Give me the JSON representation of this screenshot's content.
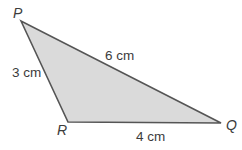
{
  "figure": {
    "kind": "geometry-diagram",
    "shape": "triangle",
    "background_color": "#ffffff",
    "fill_color": "#dadada",
    "stroke_color": "#555555",
    "text_color": "#3c3c3c",
    "stroke_width": 1.6,
    "vertices": [
      {
        "name": "P",
        "label": "P",
        "x": 21,
        "y": 21
      },
      {
        "name": "R",
        "label": "R",
        "x": 68,
        "y": 122
      },
      {
        "name": "Q",
        "label": "Q",
        "x": 221,
        "y": 123
      }
    ],
    "sides": [
      {
        "name": "PQ",
        "label": "6 cm",
        "length": 6,
        "unit": "cm"
      },
      {
        "name": "PR",
        "label": "3 cm",
        "length": 3,
        "unit": "cm"
      },
      {
        "name": "RQ",
        "label": "4 cm",
        "length": 4,
        "unit": "cm"
      }
    ]
  },
  "chart_data": {
    "type": "diagram",
    "title": "",
    "shape": "triangle",
    "vertex_labels": [
      "P",
      "R",
      "Q"
    ],
    "vertex_points": [
      [
        21,
        21
      ],
      [
        68,
        122
      ],
      [
        221,
        123
      ]
    ],
    "side_labels": [
      "6 cm",
      "3 cm",
      "4 cm"
    ],
    "side_values": [
      6,
      3,
      4
    ],
    "units": "cm"
  }
}
